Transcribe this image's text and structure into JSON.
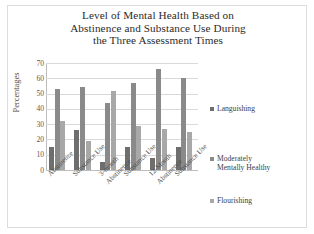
{
  "chart_data": {
    "type": "bar",
    "title": "Level of Mental Health Based on Abstinence and Substance Use During the Three Assessment Times",
    "title_lines": [
      "Level of Mental Health Based on",
      "Abstinence and Substance Use During",
      "the Three Assessment Times"
    ],
    "xlabel": "",
    "ylabel": "Percentages",
    "ylim": [
      0,
      70
    ],
    "yticks": [
      0,
      10,
      20,
      30,
      40,
      50,
      60,
      70
    ],
    "ytick_labels": [
      "0",
      "10",
      "20",
      "30",
      "40",
      "50",
      "60",
      "70"
    ],
    "grid": true,
    "legend_position": "right",
    "categories": [
      "Abstinence",
      "Substance Use",
      "3-month Abstinence",
      "Substance Use",
      "12-Month Abstinence",
      "Substance Use"
    ],
    "category_label_lines": [
      [
        "Abstinence"
      ],
      [
        "Substance Use"
      ],
      [
        "3-month",
        "Abstinence"
      ],
      [
        "Substance Use"
      ],
      [
        "12-Month",
        "Abstinence"
      ],
      [
        "Substance Use"
      ]
    ],
    "series": [
      {
        "name": "Languishing",
        "color": "#6e6e6e",
        "values": [
          15,
          26,
          5,
          15,
          8,
          15
        ]
      },
      {
        "name": "Moderately Mentally Healthy",
        "color": "#8a8a8a",
        "values": [
          53,
          54,
          44,
          57,
          66,
          60
        ]
      },
      {
        "name": "Flourishing",
        "color": "#a8a8a8",
        "values": [
          32,
          19,
          52,
          29,
          27,
          25
        ]
      }
    ],
    "legend_entries": [
      {
        "label": "Languishing",
        "lines": [
          "Languishing"
        ],
        "color": "#6e6e6e"
      },
      {
        "label": "Moderately Mentally Healthy",
        "lines": [
          "Moderately",
          "Mentally Healthy"
        ],
        "color": "#8a8a8a"
      },
      {
        "label": "Flourishing",
        "lines": [
          "Flourishing"
        ],
        "color": "#a8a8a8"
      }
    ]
  },
  "colors": {
    "background": "#ffffff",
    "frame": "#dcdcdc",
    "gridline": "#d9d9d9",
    "axis": "#bdbdbd",
    "title_text": "#2b2b2b",
    "tick_text": "#5a5a5a",
    "legend_text": "#3d3d3d"
  }
}
